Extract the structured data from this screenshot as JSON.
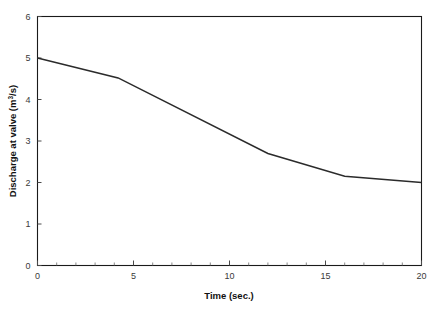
{
  "figure": {
    "background_color": "#ffffff",
    "line_color": "#2b2b2b",
    "frame_color": "#1a1a1a",
    "tick_label_color": "#3a3a3a"
  },
  "axis": {
    "y_title_prefix": "Discharge at valve (m",
    "y_title_superscript": "3",
    "y_title_suffix": "/s)",
    "x_title": "Time (sec.)"
  },
  "chart_data": {
    "type": "line",
    "title": "",
    "xlabel": "Time (sec.)",
    "ylabel": "Discharge at valve (m^3/s)",
    "xlim": [
      0,
      20
    ],
    "ylim": [
      0,
      6
    ],
    "grid": false,
    "legend": false,
    "x_ticks": [
      0,
      5,
      10,
      15,
      20
    ],
    "x_tick_labels": [
      "0",
      "5",
      "10",
      "15",
      "20"
    ],
    "x_minor_tick_step": 1,
    "y_ticks": [
      0,
      1,
      2,
      3,
      4,
      5,
      6
    ],
    "y_tick_labels": [
      "0",
      "1",
      "2",
      "3",
      "4",
      "5",
      "6"
    ],
    "series": [
      {
        "name": "Discharge at valve",
        "x": [
          0,
          4.2,
          12.0,
          16.0,
          20.0
        ],
        "values": [
          5.0,
          4.52,
          2.7,
          2.15,
          2.0
        ]
      }
    ]
  }
}
